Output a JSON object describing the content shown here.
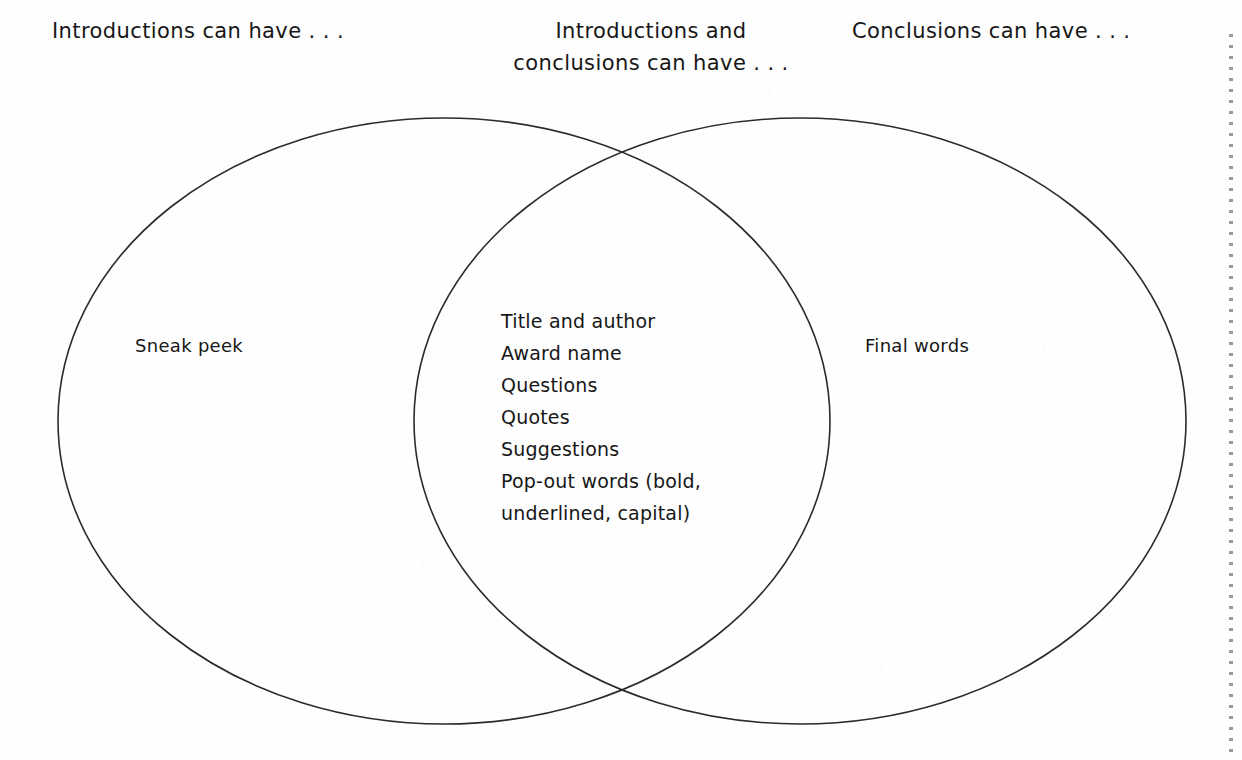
{
  "page": {
    "background_color": "#fefefe",
    "ink_color": "#2b2b2b"
  },
  "headers": {
    "left": "Introductions can have . . .",
    "center": "Introductions and\nconclusions can have . . .",
    "right": "Conclusions can have . . ."
  },
  "venn": {
    "left_circle": {
      "label": "Sneak peek"
    },
    "right_circle": {
      "label": "Final words"
    },
    "intersection": {
      "items": [
        "Title and author",
        "Award name",
        "Questions",
        "Quotes",
        "Suggestions",
        "Pop-out words (bold,",
        "underlined, capital)"
      ]
    }
  },
  "perforation": {
    "name": "tear-off-dotted-line"
  }
}
